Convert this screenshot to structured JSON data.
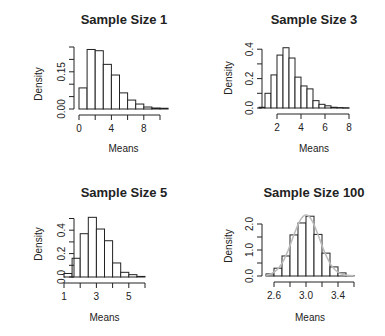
{
  "figure": {
    "layout": "2x2 grid of histograms",
    "colors": {
      "bar_fill": "#ffffff",
      "bar_stroke": "#222222",
      "axis": "#222222",
      "density_curve": "#bbbbbb",
      "background": "#ffffff"
    }
  },
  "chart_data": [
    {
      "type": "bar",
      "title": "Sample Size 1",
      "xlabel": "Means",
      "ylabel": "Density",
      "bin_edges": [
        0,
        1,
        2,
        3,
        4,
        5,
        6,
        7,
        8,
        9,
        10,
        11
      ],
      "values": [
        0.085,
        0.24,
        0.235,
        0.18,
        0.137,
        0.065,
        0.036,
        0.02,
        0.008,
        0.004,
        0.003
      ],
      "xticks": [
        0,
        2,
        4,
        6,
        8,
        10
      ],
      "xtick_labels": [
        "0",
        "",
        "4",
        "",
        "8",
        ""
      ],
      "yticks": [
        0,
        0.05,
        0.1,
        0.15,
        0.2,
        0.25
      ],
      "ytick_labels": [
        "0.00",
        "",
        "",
        "0.15",
        "",
        ""
      ],
      "xlim": [
        0,
        11
      ],
      "ylim": [
        0,
        0.25
      ],
      "grid": false,
      "legend": null
    },
    {
      "type": "bar",
      "title": "Sample Size 3",
      "xlabel": "Means",
      "ylabel": "Density",
      "bin_edges": [
        0.5,
        1.0,
        1.5,
        2.0,
        2.5,
        3.0,
        3.5,
        4.0,
        4.5,
        5.0,
        5.5,
        6.0,
        6.5,
        7.0,
        7.5,
        8.0
      ],
      "values": [
        0.005,
        0.1,
        0.225,
        0.36,
        0.41,
        0.34,
        0.21,
        0.15,
        0.13,
        0.05,
        0.025,
        0.015,
        0.005,
        0.003,
        0.002
      ],
      "xticks": [
        2,
        4,
        6,
        8
      ],
      "xtick_labels": [
        "2",
        "4",
        "6",
        "8"
      ],
      "yticks": [
        0,
        0.1,
        0.2,
        0.3,
        0.4
      ],
      "ytick_labels": [
        "0.0",
        "",
        "0.2",
        "",
        "0.4"
      ],
      "xlim": [
        0.5,
        8
      ],
      "ylim": [
        0,
        0.4
      ],
      "grid": false,
      "legend": null
    },
    {
      "type": "bar",
      "title": "Sample Size 5",
      "xlabel": "Means",
      "ylabel": "Density",
      "bin_edges": [
        1.0,
        1.5,
        2.0,
        2.5,
        3.0,
        3.5,
        4.0,
        4.5,
        5.0,
        5.5,
        6.0
      ],
      "values": [
        0.03,
        0.16,
        0.37,
        0.51,
        0.41,
        0.31,
        0.12,
        0.04,
        0.02,
        0.005
      ],
      "xticks": [
        1,
        2,
        3,
        4,
        5,
        6
      ],
      "xtick_labels": [
        "1",
        "",
        "3",
        "",
        "5",
        ""
      ],
      "yticks": [
        0,
        0.1,
        0.2,
        0.3,
        0.4,
        0.5
      ],
      "ytick_labels": [
        "0.0",
        "",
        "0.2",
        "",
        "0.4",
        ""
      ],
      "xlim": [
        1,
        6
      ],
      "ylim": [
        0,
        0.5
      ],
      "grid": false,
      "legend": null
    },
    {
      "type": "bar",
      "title": "Sample Size 100",
      "xlabel": "Means",
      "ylabel": "Density",
      "bin_edges": [
        2.5,
        2.6,
        2.7,
        2.8,
        2.9,
        3.0,
        3.1,
        3.2,
        3.3,
        3.4,
        3.5,
        3.6
      ],
      "values": [
        0.08,
        0.3,
        0.77,
        1.58,
        2.04,
        2.3,
        1.6,
        0.88,
        0.35,
        0.12,
        0.02
      ],
      "xticks": [
        2.6,
        2.8,
        3.0,
        3.2,
        3.4,
        3.6
      ],
      "xtick_labels": [
        "2.6",
        "",
        "3.0",
        "",
        "3.4",
        ""
      ],
      "yticks": [
        0,
        0.5,
        1.0,
        1.5,
        2.0
      ],
      "ytick_labels": [
        "0.0",
        "",
        "1.0",
        "",
        "2.0"
      ],
      "xlim": [
        2.5,
        3.6
      ],
      "ylim": [
        0,
        2.0
      ],
      "grid": false,
      "legend": null,
      "overlay": {
        "type": "normal_density_curve",
        "mean": 3.0,
        "sd": 0.17
      }
    }
  ],
  "panels_geometry": [
    {
      "title_x": 124,
      "title_y": 24,
      "plot_x0": 79,
      "plot_y0": 109,
      "px_per_x": 8.1,
      "px_per_y": 248,
      "ylabel_x": 42,
      "ylabel_y": 84,
      "xlabel_y": 152,
      "yaxis_x": 74,
      "xaxis_y": 115
    },
    {
      "title_x": 314,
      "title_y": 24,
      "plot_x0": 259,
      "plot_y0": 108,
      "px_per_x": 12,
      "px_per_y": 147,
      "ylabel_x": 232,
      "ylabel_y": 78,
      "xlabel_y": 152,
      "yaxis_x": 262,
      "xaxis_y": 114
    },
    {
      "title_x": 124,
      "title_y": 197,
      "plot_x0": 64,
      "plot_y0": 277,
      "px_per_x": 16.2,
      "px_per_y": 117,
      "ylabel_x": 42,
      "ylabel_y": 244,
      "xlabel_y": 321,
      "yaxis_x": 74,
      "xaxis_y": 283
    },
    {
      "title_x": 314,
      "title_y": 197,
      "plot_x0": 266,
      "plot_y0": 276,
      "px_per_x": 80,
      "px_per_y": 26,
      "ylabel_x": 232,
      "ylabel_y": 246,
      "xlabel_y": 321,
      "yaxis_x": 262,
      "xaxis_y": 282
    }
  ]
}
